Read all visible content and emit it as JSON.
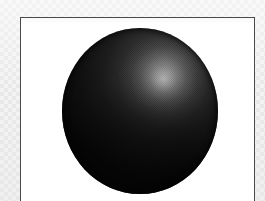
{
  "figure": {
    "caption": "",
    "alt_text": "Dark matte sphere with a bright specular highlight in the upper right",
    "background": {
      "texture": "dithered-checkerboard",
      "color": "#f2f2f2",
      "accent_color": "#e6e6e6"
    },
    "frame": {
      "border_color": "#4a4a4a",
      "border_width_px": 1,
      "fill_color": "#ffffff",
      "left_px": 20,
      "top_px": 17,
      "width_px": 235,
      "height_px": 184
    },
    "sphere": {
      "center_x_px": 139,
      "center_y_px": 110,
      "width_px": 156,
      "height_px": 166,
      "base_color": "#0a0a0a",
      "shadow_color": "#050505",
      "highlight": {
        "color": "#c9c9c9",
        "center_x_px": 162,
        "center_y_px": 61,
        "position_pct_x": 65,
        "position_pct_y": 31,
        "radius_px": 26
      }
    }
  }
}
